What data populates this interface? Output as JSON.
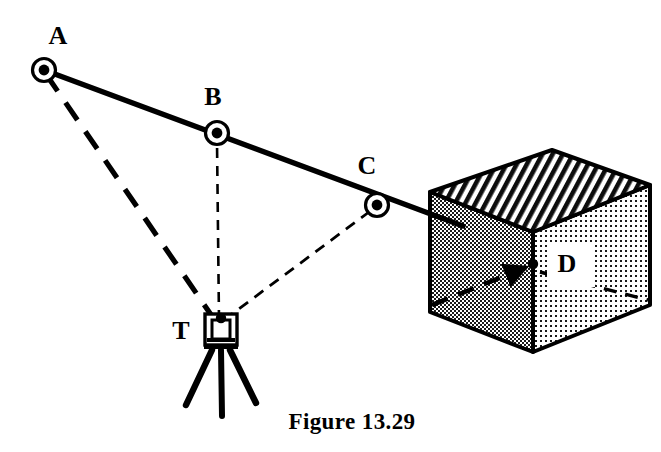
{
  "figure": {
    "caption": "Figure 13.29",
    "background_color": "#ffffff",
    "ink_color": "#000000"
  },
  "points": {
    "a": {
      "label": "A",
      "marker": "circled-dot",
      "x": 44,
      "y": 70,
      "label_x": 58,
      "label_y": 38
    },
    "b": {
      "label": "B",
      "marker": "circled-dot",
      "x": 217,
      "y": 133,
      "label_x": 213,
      "label_y": 99
    },
    "c": {
      "label": "C",
      "marker": "circled-dot",
      "x": 377,
      "y": 205,
      "label_x": 367,
      "label_y": 168
    },
    "d": {
      "label": "D",
      "marker": "arrow-target",
      "x": 534,
      "y": 264,
      "label_x": 567,
      "label_y": 266
    },
    "t": {
      "label": "T",
      "marker": "theodolite-tripod",
      "x": 220,
      "y": 325,
      "label_x": 181,
      "label_y": 333
    }
  },
  "lines": {
    "traverse": {
      "name": "traverse-line-a-to-d",
      "style": "solid-heavy",
      "from": "A",
      "to": "D"
    },
    "sight_a": {
      "name": "sight-line-t-to-a",
      "style": "dashed-heavy",
      "from": "T",
      "to": "A"
    },
    "sight_b": {
      "name": "sight-line-t-to-b",
      "style": "dashed-fine",
      "from": "T",
      "to": "B"
    },
    "sight_c": {
      "name": "sight-line-t-to-c",
      "style": "dashed-fine",
      "from": "T",
      "to": "C"
    },
    "hidden_d": {
      "name": "hidden-edge-to-d",
      "style": "dashed-heavy",
      "from": "cube-lower-left",
      "to": "D"
    }
  },
  "building": {
    "name": "cube-building",
    "top_face": {
      "fill": "hatch-diagonal",
      "color": "#000000"
    },
    "left_face": {
      "fill": "stipple-dense",
      "color": "#555555"
    },
    "right_face": {
      "fill": "stipple-light",
      "color": "#888888"
    },
    "vertices": {
      "top_back": [
        552,
        150
      ],
      "top_left": [
        430,
        192
      ],
      "top_front": [
        533,
        232
      ],
      "top_right": [
        650,
        185
      ],
      "bot_left": [
        430,
        312
      ],
      "bot_front": [
        533,
        352
      ],
      "bot_right": [
        650,
        305
      ]
    }
  },
  "instrument": {
    "name": "theodolite",
    "head_x": 220,
    "head_y": 325,
    "legs": 3
  }
}
